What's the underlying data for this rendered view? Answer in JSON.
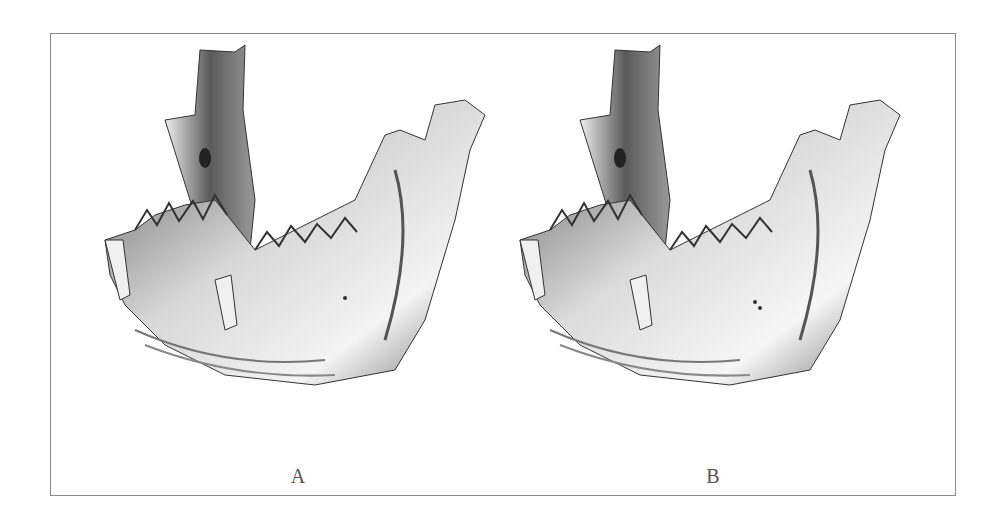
{
  "figure": {
    "panels": [
      {
        "label": "A",
        "subject": "mandible-3d-render",
        "description": "3D surface rendering of a mandible, oblique view"
      },
      {
        "label": "B",
        "subject": "mandible-3d-render",
        "description": "3D surface rendering of a mandible, oblique view (comparison)"
      }
    ],
    "colors": {
      "frame": "#8a8a8a",
      "bone_light": "#f2f2f2",
      "bone_mid": "#9a9a9a",
      "bone_dark": "#4a4a4a",
      "label": "#555555"
    }
  }
}
